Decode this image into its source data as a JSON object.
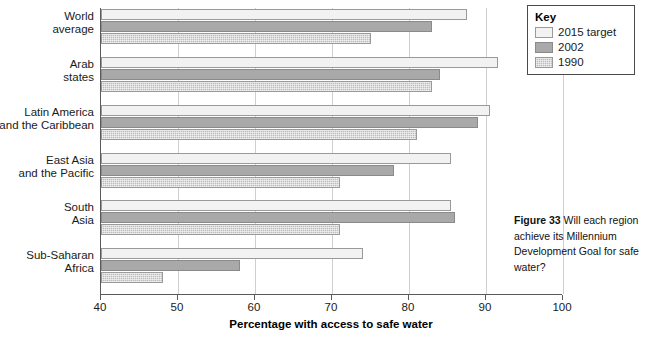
{
  "chart_data": {
    "type": "bar",
    "orientation": "horizontal",
    "title": "",
    "xlabel": "Percentage with access to safe water",
    "ylabel": "",
    "xlim": [
      40,
      100
    ],
    "xticks": [
      40,
      50,
      60,
      70,
      80,
      90,
      100
    ],
    "grid": true,
    "legend_position": "top-right",
    "legend_title": "Key",
    "categories": [
      "World average",
      "Arab states",
      "Latin America and the Caribbean",
      "East Asia and the Pacific",
      "South Asia",
      "Sub-Saharan Africa"
    ],
    "category_lines": [
      [
        "World",
        "average"
      ],
      [
        "Arab",
        "states"
      ],
      [
        "Latin America",
        "and the Caribbean"
      ],
      [
        "East Asia",
        "and the Pacific"
      ],
      [
        "South",
        "Asia"
      ],
      [
        "Sub-Saharan",
        "Africa"
      ]
    ],
    "series": [
      {
        "name": "2015 target",
        "color": "#f2f2f2",
        "values": [
          87.5,
          91.5,
          90.5,
          85.5,
          85.5,
          74.0
        ]
      },
      {
        "name": "2002",
        "color": "#a9a9a9",
        "values": [
          83.0,
          84.0,
          89.0,
          78.0,
          86.0,
          58.0
        ]
      },
      {
        "name": "1990",
        "color": "#bdbdbd",
        "values": [
          75.0,
          83.0,
          81.0,
          71.0,
          71.0,
          48.0
        ]
      }
    ]
  },
  "legend": {
    "title": "Key",
    "items": [
      {
        "label": "2015 target"
      },
      {
        "label": "2002"
      },
      {
        "label": "1990"
      }
    ]
  },
  "caption": {
    "figure_number": "Figure 33",
    "text": " Will each region achieve its Millennium Development Goal for safe water?"
  },
  "axis": {
    "x_title": "Percentage with access to safe water",
    "tick_labels": [
      "40",
      "50",
      "60",
      "70",
      "80",
      "90",
      "100"
    ]
  }
}
